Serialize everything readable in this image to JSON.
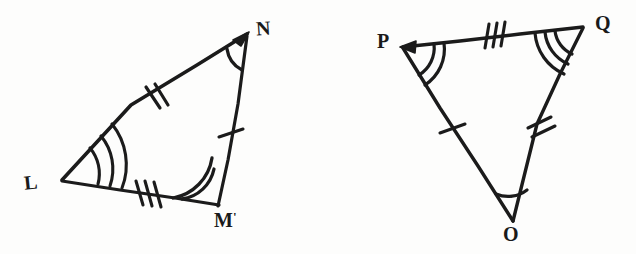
{
  "figure": {
    "ink_color": "#1b1b1b",
    "background_color": "#fdfdfc",
    "stroke_width": 3,
    "triangles": [
      {
        "id": "triangle-lmn",
        "name": "Triangle LMN",
        "vertices": [
          {
            "id": "L",
            "label": "L",
            "x": 62,
            "y": 180,
            "label_x": 24,
            "label_y": 172,
            "angle_arcs": 3
          },
          {
            "id": "M",
            "label": "M",
            "label_suffix": "'",
            "x": 218,
            "y": 205,
            "label_x": 214,
            "label_y": 212,
            "angle_arcs": 2
          },
          {
            "id": "N",
            "label": "N",
            "x": 248,
            "y": 33,
            "label_x": 258,
            "label_y": 22,
            "angle_arcs": 1
          }
        ],
        "sides": [
          {
            "id": "LN",
            "from": "L",
            "to": "N",
            "ticks": 2,
            "arrow_at": "N"
          },
          {
            "id": "LM",
            "from": "L",
            "to": "M",
            "ticks": 3,
            "arrow_at": null
          },
          {
            "id": "MN",
            "from": "M",
            "to": "N",
            "ticks": 1,
            "arrow_at": null
          }
        ]
      },
      {
        "id": "triangle-pqo",
        "name": "Triangle PQO",
        "vertices": [
          {
            "id": "P",
            "label": "P",
            "x": 402,
            "y": 47,
            "label_x": 378,
            "label_y": 34,
            "angle_arcs": 2
          },
          {
            "id": "Q",
            "label": "Q",
            "x": 583,
            "y": 26,
            "label_x": 596,
            "label_y": 16,
            "angle_arcs": 3
          },
          {
            "id": "O",
            "label": "O",
            "x": 513,
            "y": 222,
            "label_x": 505,
            "label_y": 226,
            "angle_arcs": 1
          }
        ],
        "sides": [
          {
            "id": "QP",
            "from": "Q",
            "to": "P",
            "ticks": 3,
            "arrow_at": "P"
          },
          {
            "id": "PO",
            "from": "P",
            "to": "O",
            "ticks": 1,
            "arrow_at": null
          },
          {
            "id": "QO",
            "from": "Q",
            "to": "O",
            "ticks": 2,
            "arrow_at": null
          }
        ]
      }
    ]
  }
}
